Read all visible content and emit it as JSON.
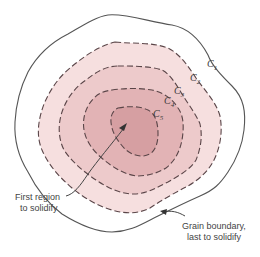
{
  "diagram": {
    "type": "solidification-contour-diagram",
    "contours": [
      {
        "id": "C1",
        "label_base": "C",
        "label_sub": "1",
        "style": "solid",
        "fill": "#ffffff"
      },
      {
        "id": "C2",
        "label_base": "C",
        "label_sub": "2",
        "style": "dashed",
        "fill": "#f5dede"
      },
      {
        "id": "C3",
        "label_base": "C",
        "label_sub": "3",
        "style": "dashed",
        "fill": "#ecc6c7"
      },
      {
        "id": "C4",
        "label_base": "C",
        "label_sub": "4",
        "style": "dashed",
        "fill": "#e0aeb0"
      },
      {
        "id": "C5",
        "label_base": "C",
        "label_sub": "5",
        "style": "dashed",
        "fill": "#d4999c"
      }
    ],
    "annotations": {
      "first_region_line1": "First region",
      "first_region_line2": "to solidify",
      "grain_boundary_line1": "Grain boundary,",
      "grain_boundary_line2": "last to solidify"
    },
    "colors": {
      "line": "#555555",
      "dash": "#5a4548"
    }
  }
}
